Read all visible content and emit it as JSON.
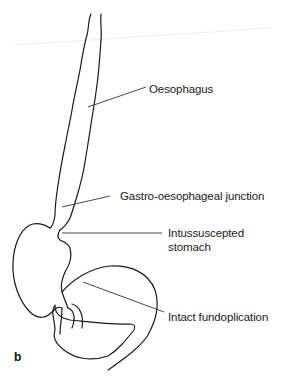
{
  "figure": {
    "panel_label": "b",
    "labels": {
      "oesophagus": "Oesophagus",
      "ge_junction": "Gastro-oesophageal junction",
      "intussuscepted_1": "Intussuscepted",
      "intussuscepted_2": "stomach",
      "fundoplication": "Intact fundoplication"
    },
    "colors": {
      "line": "#1a1a1a",
      "leader": "#333333"
    }
  }
}
